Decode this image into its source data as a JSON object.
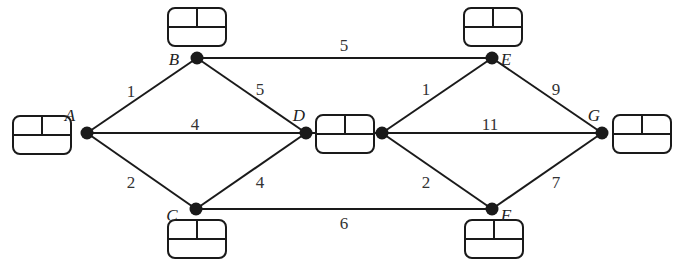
{
  "diagram": {
    "type": "network",
    "nodes": [
      {
        "id": "A",
        "label": "A",
        "x": 87,
        "y": 133,
        "lx": 70,
        "ly": 121,
        "box": {
          "x": 13,
          "y": 116
        }
      },
      {
        "id": "B",
        "label": "B",
        "x": 197,
        "y": 58,
        "lx": 174,
        "ly": 65,
        "box": {
          "x": 168,
          "y": 8
        }
      },
      {
        "id": "C",
        "label": "C",
        "x": 196,
        "y": 209,
        "lx": 172,
        "ly": 221,
        "box": {
          "x": 168,
          "y": 220
        }
      },
      {
        "id": "D",
        "label": "D",
        "x": 306,
        "y": 133,
        "lx": 299,
        "ly": 121,
        "box": {
          "x": 316,
          "y": 115
        }
      },
      {
        "id": "D2",
        "label": "",
        "x": 382,
        "y": 133,
        "lx": 0,
        "ly": 0,
        "box": null
      },
      {
        "id": "E",
        "label": "E",
        "x": 492,
        "y": 58,
        "lx": 506,
        "ly": 65,
        "box": {
          "x": 464,
          "y": 8
        }
      },
      {
        "id": "F",
        "label": "F",
        "x": 492,
        "y": 209,
        "lx": 506,
        "ly": 221,
        "box": {
          "x": 465,
          "y": 220
        }
      },
      {
        "id": "G",
        "label": "G",
        "x": 602,
        "y": 133,
        "lx": 594,
        "ly": 121,
        "box": {
          "x": 613,
          "y": 115
        }
      }
    ],
    "edges": [
      {
        "from": "A",
        "to": "B",
        "weight": "1",
        "lx": 131,
        "ly": 97
      },
      {
        "from": "A",
        "to": "D",
        "weight": "4",
        "lx": 195,
        "ly": 130
      },
      {
        "from": "A",
        "to": "C",
        "weight": "2",
        "lx": 131,
        "ly": 188
      },
      {
        "from": "B",
        "to": "D",
        "weight": "5",
        "lx": 260,
        "ly": 95
      },
      {
        "from": "C",
        "to": "D",
        "weight": "4",
        "lx": 260,
        "ly": 188
      },
      {
        "from": "B",
        "to": "E",
        "weight": "5",
        "lx": 344,
        "ly": 51
      },
      {
        "from": "C",
        "to": "F",
        "weight": "6",
        "lx": 344,
        "ly": 229
      },
      {
        "from": "D2",
        "to": "E",
        "weight": "1",
        "lx": 426,
        "ly": 95
      },
      {
        "from": "D2",
        "to": "G",
        "weight": "11",
        "lx": 490,
        "ly": 130
      },
      {
        "from": "D2",
        "to": "F",
        "weight": "2",
        "lx": 426,
        "ly": 188
      },
      {
        "from": "E",
        "to": "G",
        "weight": "9",
        "lx": 556,
        "ly": 95
      },
      {
        "from": "F",
        "to": "G",
        "weight": "7",
        "lx": 556,
        "ly": 188
      }
    ],
    "box_size": {
      "w": 58,
      "h": 38,
      "rx": 7
    }
  }
}
